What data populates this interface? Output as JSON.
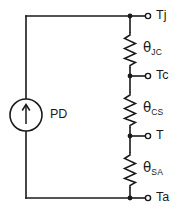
{
  "diagram": {
    "background_color": "#ffffff",
    "line_color": "#1a1a1a",
    "source": {
      "label": "PD",
      "symbol": "current-source"
    },
    "resistors": [
      {
        "id": "jc",
        "symbol": "θ",
        "subscript": "JC",
        "label": "θJC"
      },
      {
        "id": "cs",
        "symbol": "θ",
        "subscript": "CS",
        "label": "θCS"
      },
      {
        "id": "sa",
        "symbol": "θ",
        "subscript": "SA",
        "label": "θSA"
      }
    ],
    "terminals": [
      {
        "id": "tj",
        "label": "Tj"
      },
      {
        "id": "tc",
        "label": "Tc"
      },
      {
        "id": "t",
        "label": "T"
      },
      {
        "id": "ta",
        "label": "Ta"
      }
    ]
  }
}
